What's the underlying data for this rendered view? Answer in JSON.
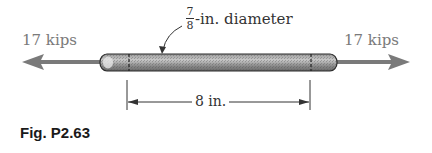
{
  "figure": {
    "caption": "Fig. P2.63",
    "load_left": "17 kips",
    "load_right": "17 kips",
    "diameter_label": {
      "numerator": "7",
      "denominator": "8",
      "suffix": "-in. diameter"
    },
    "length_label": "8 in."
  },
  "colors": {
    "arrow": "#7a7a7a",
    "rod_dark": "#6e6e6e",
    "rod_light": "#d8d8d8",
    "line": "#333333"
  }
}
